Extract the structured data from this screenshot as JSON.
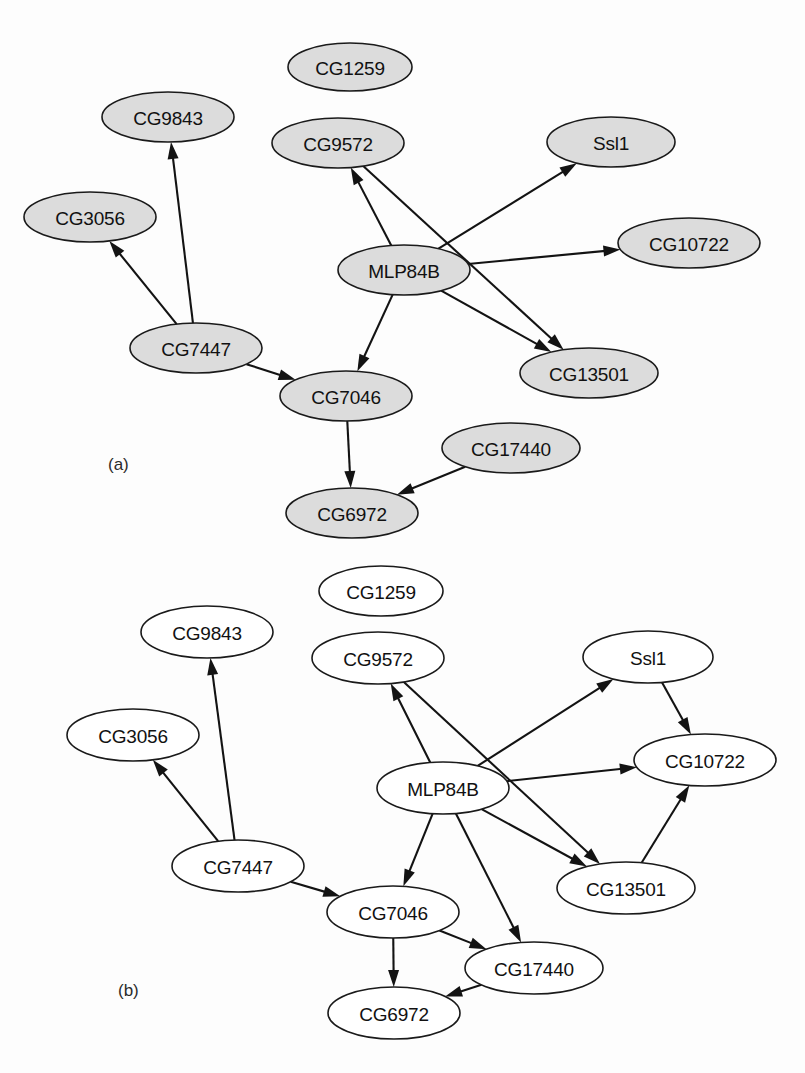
{
  "figure": {
    "background_color": "#fdfdfd",
    "width": 805,
    "height": 1073,
    "node_stroke_color": "#1a1a1a",
    "edge_color": "#131313",
    "label_color": "#111111"
  },
  "panels": [
    {
      "id": "panel-a",
      "caption": "(a)",
      "caption_x": 108,
      "caption_y": 464,
      "node_fill": "#dcdcdc",
      "nodes": [
        {
          "id": "CG1259",
          "label": "CG1259",
          "cx": 350,
          "cy": 67,
          "rx": 62,
          "ry": 24
        },
        {
          "id": "CG9843",
          "label": "CG9843",
          "cx": 168,
          "cy": 117,
          "rx": 66,
          "ry": 25
        },
        {
          "id": "CG9572",
          "label": "CG9572",
          "cx": 338,
          "cy": 143,
          "rx": 66,
          "ry": 25
        },
        {
          "id": "Ssl1",
          "label": "Ssl1",
          "cx": 611,
          "cy": 142,
          "rx": 64,
          "ry": 25
        },
        {
          "id": "CG3056",
          "label": "CG3056",
          "cx": 90,
          "cy": 217,
          "rx": 66,
          "ry": 25
        },
        {
          "id": "CG10722",
          "label": "CG10722",
          "cx": 689,
          "cy": 243,
          "rx": 71,
          "ry": 25
        },
        {
          "id": "MLP84B",
          "label": "MLP84B",
          "cx": 404,
          "cy": 270,
          "rx": 66,
          "ry": 25
        },
        {
          "id": "CG7447",
          "label": "CG7447",
          "cx": 196,
          "cy": 348,
          "rx": 66,
          "ry": 25
        },
        {
          "id": "CG13501",
          "label": "CG13501",
          "cx": 589,
          "cy": 373,
          "rx": 69,
          "ry": 25
        },
        {
          "id": "CG7046",
          "label": "CG7046",
          "cx": 346,
          "cy": 396,
          "rx": 66,
          "ry": 25
        },
        {
          "id": "CG17440",
          "label": "CG17440",
          "cx": 511,
          "cy": 448,
          "rx": 69,
          "ry": 25
        },
        {
          "id": "CG6972",
          "label": "CG6972",
          "cx": 352,
          "cy": 513,
          "rx": 66,
          "ry": 25
        }
      ],
      "edges": [
        {
          "from": "CG7447",
          "to": "CG9843"
        },
        {
          "from": "CG7447",
          "to": "CG3056"
        },
        {
          "from": "CG7447",
          "to": "CG7046"
        },
        {
          "from": "MLP84B",
          "to": "CG9572"
        },
        {
          "from": "MLP84B",
          "to": "Ssl1"
        },
        {
          "from": "MLP84B",
          "to": "CG10722"
        },
        {
          "from": "MLP84B",
          "to": "CG13501"
        },
        {
          "from": "MLP84B",
          "to": "CG7046"
        },
        {
          "from": "CG9572",
          "to": "CG13501"
        },
        {
          "from": "CG7046",
          "to": "CG6972"
        },
        {
          "from": "CG17440",
          "to": "CG6972"
        }
      ]
    },
    {
      "id": "panel-b",
      "caption": "(b)",
      "caption_x": 118,
      "caption_y": 990,
      "node_fill": "#ffffff",
      "nodes": [
        {
          "id": "CG1259",
          "label": "CG1259",
          "cx": 381,
          "cy": 591,
          "rx": 62,
          "ry": 25
        },
        {
          "id": "CG9843",
          "label": "CG9843",
          "cx": 207,
          "cy": 632,
          "rx": 66,
          "ry": 26
        },
        {
          "id": "CG9572",
          "label": "CG9572",
          "cx": 378,
          "cy": 658,
          "rx": 66,
          "ry": 26
        },
        {
          "id": "Ssl1",
          "label": "Ssl1",
          "cx": 648,
          "cy": 657,
          "rx": 65,
          "ry": 26
        },
        {
          "id": "CG3056",
          "label": "CG3056",
          "cx": 133,
          "cy": 735,
          "rx": 66,
          "ry": 26
        },
        {
          "id": "CG10722",
          "label": "CG10722",
          "cx": 705,
          "cy": 760,
          "rx": 71,
          "ry": 26
        },
        {
          "id": "MLP84B",
          "label": "MLP84B",
          "cx": 443,
          "cy": 788,
          "rx": 66,
          "ry": 26
        },
        {
          "id": "CG7447",
          "label": "CG7447",
          "cx": 238,
          "cy": 866,
          "rx": 66,
          "ry": 26
        },
        {
          "id": "CG13501",
          "label": "CG13501",
          "cx": 626,
          "cy": 888,
          "rx": 69,
          "ry": 26
        },
        {
          "id": "CG7046",
          "label": "CG7046",
          "cx": 393,
          "cy": 912,
          "rx": 66,
          "ry": 26
        },
        {
          "id": "CG17440",
          "label": "CG17440",
          "cx": 534,
          "cy": 968,
          "rx": 69,
          "ry": 26
        },
        {
          "id": "CG6972",
          "label": "CG6972",
          "cx": 394,
          "cy": 1013,
          "rx": 66,
          "ry": 26
        }
      ],
      "edges": [
        {
          "from": "CG7447",
          "to": "CG9843"
        },
        {
          "from": "CG7447",
          "to": "CG3056"
        },
        {
          "from": "CG7447",
          "to": "CG7046"
        },
        {
          "from": "MLP84B",
          "to": "CG9572"
        },
        {
          "from": "MLP84B",
          "to": "Ssl1"
        },
        {
          "from": "MLP84B",
          "to": "CG10722"
        },
        {
          "from": "MLP84B",
          "to": "CG13501"
        },
        {
          "from": "MLP84B",
          "to": "CG7046"
        },
        {
          "from": "MLP84B",
          "to": "CG17440"
        },
        {
          "from": "CG9572",
          "to": "CG13501"
        },
        {
          "from": "Ssl1",
          "to": "CG10722"
        },
        {
          "from": "CG13501",
          "to": "CG10722"
        },
        {
          "from": "CG7046",
          "to": "CG6972"
        },
        {
          "from": "CG7046",
          "to": "CG17440"
        },
        {
          "from": "CG17440",
          "to": "CG6972"
        }
      ]
    }
  ]
}
